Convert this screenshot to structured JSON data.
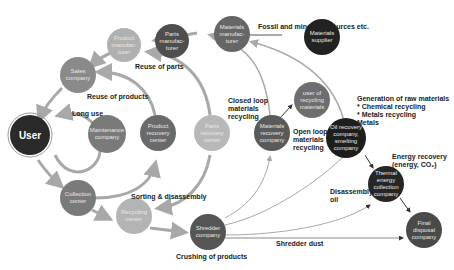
{
  "nodes": {
    "user": {
      "label": "User",
      "color": "#2a2a2a"
    },
    "product_manufacturer": {
      "label": "Product\nmanufac-\nturer",
      "color": "#b0b0b0"
    },
    "parts_manufacturer": {
      "label": "Parts\nmanufac-\nturer",
      "color": "#4e4e4e"
    },
    "materials_manufacturer": {
      "label": "Materials\nmanufac-\nturer",
      "color": "#666666"
    },
    "materials_supplier": {
      "label": "Materials\nsupplier",
      "color": "#222222"
    },
    "sales_company": {
      "label": "Sales\ncompany",
      "color": "#8a8a8a"
    },
    "maintenance_company": {
      "label": "Maintenance\ncompany",
      "color": "#7a7a7a"
    },
    "product_recovery_center": {
      "label": "Product\nrecovery\ncenter",
      "color": "#6a6a6a"
    },
    "parts_recovery_center": {
      "label": "Parts\nrecovery\ncenter",
      "color": "#b8b8b8"
    },
    "materials_recovery_company": {
      "label": "Materials\nrecovery\ncompany",
      "color": "#5a5a5a"
    },
    "user_of_recycling_materials": {
      "label": "user of\nrecycling\nmaterials",
      "color": "#6e6e6e"
    },
    "oil_recovery_company": {
      "label": "Oil recovery\ncompany,\nsmelting\ncompany",
      "color": "#1e1e1e"
    },
    "thermal_energy_collection_company": {
      "label": "Thermal\nenergy\ncollection\ncompany",
      "color": "#262626"
    },
    "final_disposal_company": {
      "label": "Final\ndisposal\ncompany",
      "color": "#4a4a4a"
    },
    "collection_center": {
      "label": "Collection\ncenter",
      "color": "#7a7a7a"
    },
    "recycling_center": {
      "label": "Recycling\ncenter",
      "color": "#b4b4b4"
    },
    "shredder_company": {
      "label": "Shredder\ncompany",
      "color": "#555555"
    }
  },
  "labels": {
    "fossil": "Fossil and mineral resources etc.",
    "reuse_parts": "Reuse of parts",
    "reuse_products": "Reuse of products",
    "long_use": "Long use",
    "closed_loop": "Closed loop\nmaterials\nrecycling",
    "open_loop": "Open loop\nmaterials\nrecycling",
    "generation": "Generation of raw materials\n* Chemical recycling\n* Metals recycling\nMetals",
    "energy_recovery": "Energy recovery\n(energy, CO₂)",
    "disassembly_oil": "Disassembly\noil",
    "sorting": "Sorting & disassembly",
    "shredder_dust": "Shredder dust",
    "crushing": "Crushing of products"
  }
}
